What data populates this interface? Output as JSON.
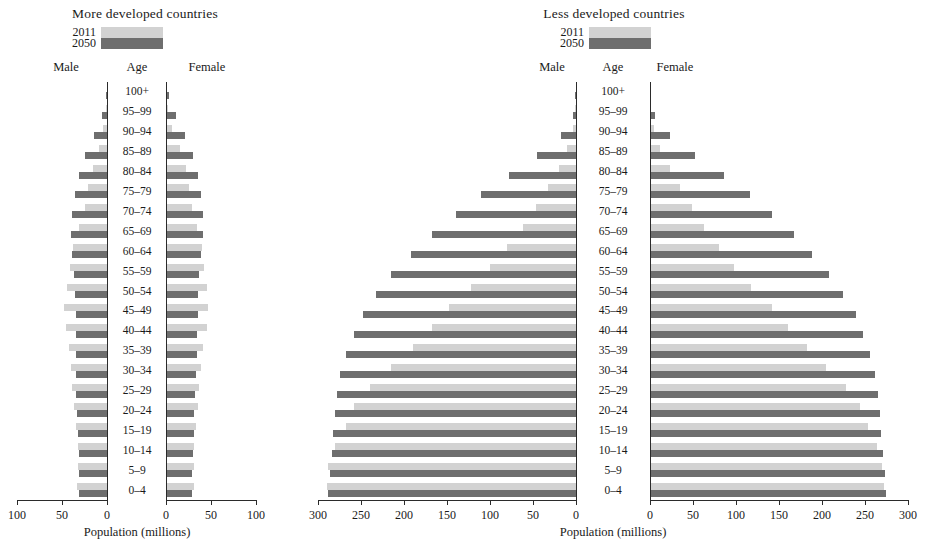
{
  "figure": {
    "bar_2011_color": "#d2d2d2",
    "bar_2050_color": "#6e6e6e",
    "axis_color": "#2b2b2b"
  },
  "chart_data": [
    {
      "type": "bar",
      "subtype": "population-pyramid",
      "title": "More developed countries",
      "xlabel": "Population (millions)",
      "ylabel": "Age",
      "categories": [
        "0–4",
        "5–9",
        "10–14",
        "15–19",
        "20–24",
        "25–29",
        "30–34",
        "35–39",
        "40–44",
        "45–49",
        "50–54",
        "55–59",
        "60–64",
        "65–69",
        "70–74",
        "75–79",
        "80–84",
        "85–89",
        "90–94",
        "95–99",
        "100+"
      ],
      "xlim": [
        0,
        100
      ],
      "xticks": [
        100,
        50,
        0,
        0,
        50,
        100
      ],
      "xticks_left": [
        100,
        50,
        0
      ],
      "xticks_right": [
        0,
        50,
        100
      ],
      "grid": false,
      "legend": [
        "2011",
        "2050"
      ],
      "legend_position": "top-left",
      "side_labels": {
        "left": "Male",
        "center": "Age",
        "right": "Female"
      },
      "series": [
        {
          "name": "2011",
          "side": "male",
          "values": [
            33,
            32,
            32,
            35,
            37,
            39,
            40,
            42,
            46,
            48,
            45,
            41,
            38,
            31,
            25,
            21,
            16,
            9,
            4,
            1,
            0
          ]
        },
        {
          "name": "2050",
          "side": "male",
          "values": [
            31,
            31,
            31,
            32,
            33,
            34,
            35,
            35,
            35,
            35,
            36,
            37,
            39,
            40,
            39,
            36,
            31,
            24,
            15,
            6,
            1
          ]
        },
        {
          "name": "2011",
          "side": "female",
          "values": [
            31,
            31,
            31,
            33,
            35,
            37,
            39,
            41,
            45,
            47,
            45,
            42,
            40,
            34,
            29,
            26,
            22,
            15,
            7,
            2,
            0
          ]
        },
        {
          "name": "2050",
          "side": "female",
          "values": [
            29,
            29,
            30,
            31,
            31,
            32,
            33,
            34,
            34,
            35,
            36,
            37,
            39,
            41,
            41,
            39,
            36,
            30,
            21,
            11,
            3
          ]
        }
      ]
    },
    {
      "type": "bar",
      "subtype": "population-pyramid",
      "title": "Less developed countries",
      "xlabel": "Population (millions)",
      "ylabel": "Age",
      "categories": [
        "0–4",
        "5–9",
        "10–14",
        "15–19",
        "20–24",
        "25–29",
        "30–34",
        "35–39",
        "40–44",
        "45–49",
        "50–54",
        "55–59",
        "60–64",
        "65–69",
        "70–74",
        "75–79",
        "80–84",
        "85–89",
        "90–94",
        "95–99",
        "100+"
      ],
      "xlim": [
        0,
        300
      ],
      "xticks_left": [
        300,
        250,
        200,
        150,
        100,
        50,
        0
      ],
      "xticks_right": [
        0,
        50,
        100,
        150,
        200,
        250,
        300
      ],
      "grid": false,
      "legend": [
        "2011",
        "2050"
      ],
      "legend_position": "top-left",
      "side_labels": {
        "left": "Male",
        "center": "Age",
        "right": "Female"
      },
      "series": [
        {
          "name": "2011",
          "side": "male",
          "values": [
            290,
            288,
            280,
            268,
            258,
            240,
            215,
            190,
            168,
            148,
            122,
            100,
            80,
            62,
            46,
            32,
            20,
            10,
            4,
            1,
            0
          ]
        },
        {
          "name": "2050",
          "side": "male",
          "values": [
            288,
            286,
            284,
            282,
            280,
            278,
            275,
            268,
            258,
            248,
            232,
            215,
            192,
            168,
            140,
            110,
            78,
            45,
            18,
            4,
            1
          ]
        },
        {
          "name": "2011",
          "side": "female",
          "values": [
            272,
            270,
            264,
            253,
            244,
            228,
            205,
            182,
            161,
            142,
            118,
            98,
            80,
            63,
            49,
            35,
            23,
            12,
            5,
            1,
            0
          ]
        },
        {
          "name": "2050",
          "side": "female",
          "values": [
            274,
            273,
            271,
            269,
            268,
            265,
            262,
            256,
            248,
            239,
            224,
            208,
            188,
            167,
            142,
            116,
            86,
            52,
            23,
            6,
            1
          ]
        }
      ]
    }
  ]
}
